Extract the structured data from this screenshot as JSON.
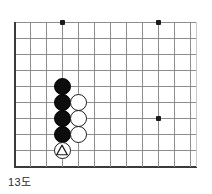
{
  "figure": {
    "caption": "13도",
    "kind": "go-board-diagram",
    "colors": {
      "background": "#ffffff",
      "grid_line": "#8c8c8c",
      "board_edge": "#3a3a3a",
      "grid_line_faded": "#c9c9c9",
      "black_stone": "#0d0d0d",
      "white_stone": "#ffffff",
      "stone_outline": "#1a1a1a",
      "star_point": "#1a1a1a",
      "caption_text": "#2b2b2b"
    }
  },
  "board": {
    "origin_x": 14,
    "origin_y": 22,
    "cell": 16,
    "columns": 12,
    "rows": 9,
    "left_edge_x": 14,
    "bottom_edge_y": 166,
    "vertical_lines_x": [
      14,
      30,
      46,
      62,
      78,
      94,
      110,
      126,
      142,
      158,
      174,
      190
    ],
    "horizontal_lines_y": [
      22,
      38,
      54,
      70,
      86,
      102,
      118,
      134,
      150,
      166
    ],
    "faded_vertical_lines_x": [
      196
    ],
    "faded_horizontal_lines_y": [],
    "star_points": [
      {
        "name": "hoshi-top-left",
        "x": 62,
        "y": 22
      },
      {
        "name": "hoshi-top-right",
        "x": 158,
        "y": 22
      },
      {
        "name": "hoshi-center-right",
        "x": 158,
        "y": 118
      }
    ],
    "stones": [
      {
        "name": "black-stone-1",
        "color": "black",
        "x": 62,
        "y": 86,
        "mark": ""
      },
      {
        "name": "black-stone-2",
        "color": "black",
        "x": 62,
        "y": 102,
        "mark": ""
      },
      {
        "name": "black-stone-3",
        "color": "black",
        "x": 62,
        "y": 118,
        "mark": ""
      },
      {
        "name": "black-stone-4",
        "color": "black",
        "x": 62,
        "y": 134,
        "mark": ""
      },
      {
        "name": "white-stone-1",
        "color": "white",
        "x": 78,
        "y": 102,
        "mark": ""
      },
      {
        "name": "white-stone-2",
        "color": "white",
        "x": 78,
        "y": 118,
        "mark": ""
      },
      {
        "name": "white-stone-3",
        "color": "white",
        "x": 78,
        "y": 134,
        "mark": ""
      },
      {
        "name": "white-stone-triangle",
        "color": "white",
        "x": 62,
        "y": 150,
        "mark": "triangle"
      }
    ]
  }
}
